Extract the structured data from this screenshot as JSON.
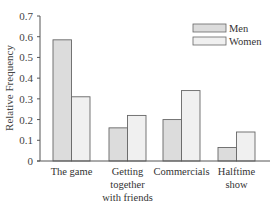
{
  "chart_data": {
    "type": "bar",
    "title": "",
    "xlabel": "",
    "ylabel": "Relative Frequency",
    "ylim": [
      0,
      0.7
    ],
    "yticks": [
      0,
      0.1,
      0.2,
      0.3,
      0.4,
      0.5,
      0.6,
      0.7
    ],
    "ytick_labels": [
      "0",
      "0.1",
      "0.2",
      "0.3",
      "0.4",
      "0.5",
      "0.6",
      "0.7"
    ],
    "grid": false,
    "legend_position": "top-right",
    "categories": [
      "The game",
      "Getting together with friends",
      "Commercials",
      "Halftime show"
    ],
    "category_label_lines": [
      [
        "The game"
      ],
      [
        "Getting",
        "together",
        "with friends"
      ],
      [
        "Commercials"
      ],
      [
        "Halftime",
        "show"
      ]
    ],
    "series": [
      {
        "name": "Men",
        "color": "#dcdcdc",
        "values": [
          0.585,
          0.16,
          0.2,
          0.065
        ]
      },
      {
        "name": "Women",
        "color": "#f0f0f0",
        "values": [
          0.31,
          0.22,
          0.34,
          0.14
        ]
      }
    ]
  },
  "legend": {
    "men": "Men",
    "women": "Women"
  },
  "axis": {
    "ylabel": "Relative Frequency"
  }
}
